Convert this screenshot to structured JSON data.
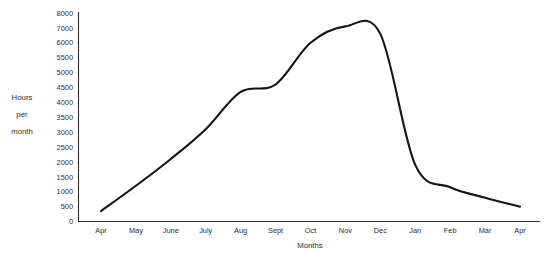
{
  "chart_data": {
    "type": "line",
    "title": "",
    "xlabel": "Months",
    "ylabel": "Hours per month",
    "ylabel_lines": [
      "Hours",
      "per",
      "month"
    ],
    "grid": false,
    "legend": false,
    "axis_color": "#2b2b2b",
    "series_color": "#141414",
    "background": "#ffffff",
    "categories": [
      "Apr",
      "May",
      "June",
      "July",
      "Aug",
      "Sept",
      "Oct",
      "Nov",
      "Dec",
      "Jan",
      "Feb",
      "Mar",
      "Apr"
    ],
    "ytick_labels": [
      "0",
      "500",
      "1000",
      "1500",
      "2000",
      "2500",
      "3000",
      "3500",
      "4000",
      "4500",
      "5000",
      "5500",
      "6000",
      "7000",
      "8000"
    ],
    "ytick_values": [
      0,
      500,
      1000,
      1500,
      2000,
      2500,
      3000,
      3500,
      4000,
      4500,
      5000,
      5500,
      6000,
      7000,
      8000
    ],
    "y_scale_note": "non-uniform: evenly spaced label slots, 500 steps up to 6000 then 1000 steps",
    "ylim": [
      0,
      8000
    ],
    "series": [
      {
        "name": "Hours per month",
        "values": [
          350,
          1200,
          2100,
          3100,
          4350,
          4600,
          6000,
          7100,
          6600,
          1900,
          1150,
          800,
          500
        ]
      }
    ]
  }
}
